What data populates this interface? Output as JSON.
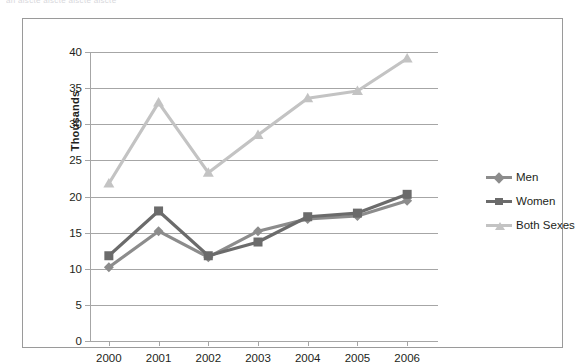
{
  "page": {
    "top_clipped_text": "an aiscte aiscte aiscte       aiscte"
  },
  "legend": {
    "position": "right",
    "items": [
      {
        "label": "Men",
        "color": "#8c8c8c",
        "marker": "diamond"
      },
      {
        "label": "Women",
        "color": "#6b6b6b",
        "marker": "square"
      },
      {
        "label": "Both Sexes",
        "color": "#c3c3c3",
        "marker": "triangle"
      }
    ]
  },
  "chart_data": {
    "type": "line",
    "title": "",
    "subtitle": "",
    "xlabel": "",
    "ylabel": "Thousands",
    "categories": [
      "2000",
      "2001",
      "2002",
      "2003",
      "2004",
      "2005",
      "2006"
    ],
    "x": [
      2000,
      2001,
      2002,
      2003,
      2004,
      2005,
      2006
    ],
    "ylim": [
      0,
      40
    ],
    "yticks": [
      0,
      5,
      10,
      15,
      20,
      25,
      30,
      35,
      40
    ],
    "ytick_labels": [
      "0",
      "5",
      "10",
      "15",
      "20",
      "25",
      "30",
      "35",
      "40"
    ],
    "grid": true,
    "grid_axis": "y",
    "legend_position": "right",
    "series": [
      {
        "name": "Men",
        "color": "#8c8c8c",
        "marker": "diamond",
        "values": [
          10.2,
          15.2,
          11.6,
          15.2,
          16.9,
          17.3,
          19.4
        ]
      },
      {
        "name": "Women",
        "color": "#6b6b6b",
        "marker": "square",
        "values": [
          11.8,
          18.0,
          11.8,
          13.7,
          17.2,
          17.7,
          20.3
        ]
      },
      {
        "name": "Both Sexes",
        "color": "#c3c3c3",
        "marker": "triangle",
        "values": [
          21.8,
          33.0,
          23.3,
          28.5,
          33.6,
          34.6,
          39.1
        ]
      }
    ]
  }
}
